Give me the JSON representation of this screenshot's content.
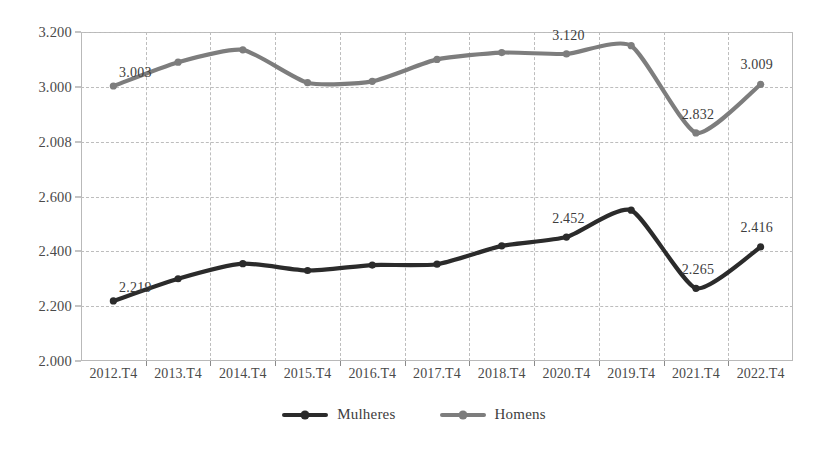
{
  "chart_data": {
    "type": "line",
    "title": "",
    "xlabel": "",
    "ylabel": "",
    "categories": [
      "2012.T4",
      "2013.T4",
      "2014.T4",
      "2015.T4",
      "2016.T4",
      "2017.T4",
      "2018.T4",
      "2020.T4",
      "2019.T4",
      "2021.T4",
      "2022.T4"
    ],
    "ytick_labels": [
      "3.200",
      "3.000",
      "2.008",
      "2.600",
      "2.400",
      "2.200",
      "2.000"
    ],
    "ytick_values": [
      3.2,
      3.0,
      2.8,
      2.6,
      2.4,
      2.2,
      2.0
    ],
    "ylim": [
      2.0,
      3.2
    ],
    "grid": true,
    "legend_position": "bottom-center",
    "series": [
      {
        "name": "Mulheres",
        "color": "#2b2b2b",
        "values": [
          2.219,
          2.3,
          2.355,
          2.33,
          2.35,
          2.353,
          2.42,
          2.452,
          2.55,
          2.265,
          2.416
        ],
        "labels": [
          "2.219",
          "",
          "",
          "",
          "",
          "",
          "",
          "2.452",
          "",
          "2.265",
          "2.416"
        ]
      },
      {
        "name": "Homens",
        "color": "#7d7d7d",
        "values": [
          3.003,
          3.09,
          3.135,
          3.015,
          3.02,
          3.1,
          3.125,
          3.12,
          3.15,
          2.832,
          3.009
        ],
        "labels": [
          "3.003",
          "",
          "",
          "",
          "",
          "",
          "",
          "3.120",
          "",
          "2.832",
          "3.009"
        ]
      }
    ]
  },
  "legend": {
    "items": [
      {
        "label": "Mulheres",
        "color": "#2b2b2b"
      },
      {
        "label": "Homens",
        "color": "#7d7d7d"
      }
    ]
  }
}
